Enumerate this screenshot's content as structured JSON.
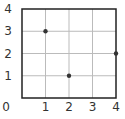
{
  "chart_data": {
    "type": "scatter",
    "title": "",
    "xlabel": "",
    "ylabel": "",
    "xlim": [
      0,
      4
    ],
    "ylim": [
      0,
      4
    ],
    "grid": true,
    "x_ticks": [
      "0",
      "1",
      "2",
      "3",
      "4"
    ],
    "y_ticks": [
      "1",
      "2",
      "3",
      "4"
    ],
    "points": [
      {
        "x": 1,
        "y": 3
      },
      {
        "x": 2,
        "y": 1
      },
      {
        "x": 4,
        "y": 2
      }
    ],
    "colors": {
      "axis": "#222222",
      "grid": "#bbbbbb",
      "point": "#333333"
    }
  }
}
